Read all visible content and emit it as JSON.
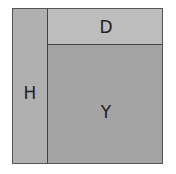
{
  "diagram": {
    "regions": [
      {
        "id": "H",
        "label": "H"
      },
      {
        "id": "D",
        "label": "D"
      },
      {
        "id": "Y",
        "label": "Y"
      }
    ],
    "colors": {
      "H": "#b0b0b0",
      "D": "#bdbdbd",
      "Y": "#a4a4a4",
      "border": "#444444"
    }
  }
}
